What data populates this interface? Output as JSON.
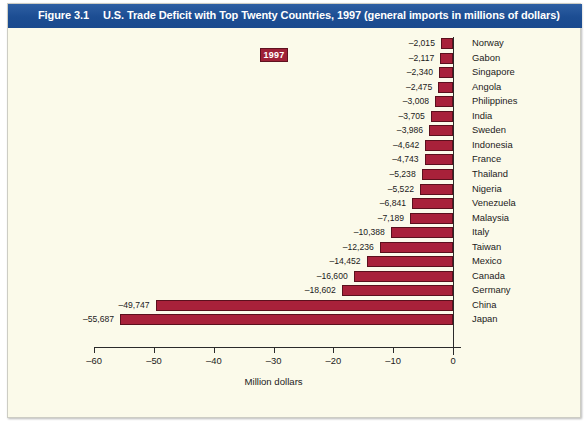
{
  "figure": {
    "number_label": "Figure 3.1",
    "title": "U.S. Trade Deficit with Top Twenty Countries, 1997 (general imports in millions of dollars)"
  },
  "legend": {
    "items": [
      {
        "label": "1997",
        "color": "#9e2137"
      }
    ]
  },
  "colors": {
    "banner": "#1d4f96",
    "bar": "#a8213a",
    "bar_outline": "#5b101d",
    "background": "#fbfaea",
    "axis": "#2b2b2b"
  },
  "chart_data": {
    "type": "bar",
    "orientation": "horizontal",
    "title": "U.S. Trade Deficit with Top Twenty Countries, 1997 (general imports in millions of dollars)",
    "xlabel": "Million dollars",
    "ylabel": "",
    "xlim": [
      -60,
      0
    ],
    "xticks": [
      -60,
      -50,
      -40,
      -30,
      -20,
      -10,
      0
    ],
    "xtick_labels": [
      "–60",
      "–50",
      "–40",
      "–30",
      "–20",
      "–10",
      "0"
    ],
    "grid": false,
    "legend_position": "top-center",
    "series_name": "1997",
    "value_unit": "millions of dollars",
    "value_scale_note": "Bar lengths plotted in thousands of millions; axis labelled –60 to 0",
    "categories": [
      "Norway",
      "Gabon",
      "Singapore",
      "Angola",
      "Philippines",
      "India",
      "Sweden",
      "Indonesia",
      "France",
      "Thailand",
      "Nigeria",
      "Venezuela",
      "Malaysia",
      "Italy",
      "Taiwan",
      "Mexico",
      "Canada",
      "Germany",
      "China",
      "Japan"
    ],
    "values": [
      -2015,
      -2117,
      -2340,
      -2475,
      -3008,
      -3705,
      -3986,
      -4642,
      -4743,
      -5238,
      -5522,
      -6841,
      -7189,
      -10388,
      -12236,
      -14452,
      -16600,
      -18602,
      -49747,
      -55687
    ],
    "value_labels": [
      "–2,015",
      "–2,117",
      "–2,340",
      "–2,475",
      "–3,008",
      "–3,705",
      "–3,986",
      "–4,642",
      "–4,743",
      "–5,238",
      "–5,522",
      "–6,841",
      "–7,189",
      "–10,388",
      "–12,236",
      "–14,452",
      "–16,600",
      "–18,602",
      "–49,747",
      "–55,687"
    ]
  }
}
